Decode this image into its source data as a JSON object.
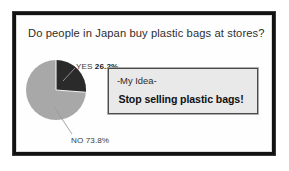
{
  "slide": {
    "title": "Do people in Japan buy plastic bags at stores?"
  },
  "idea_box": {
    "heading": "-My Idea-",
    "statement": "Stop selling plastic bags!"
  },
  "labels": {
    "yes_prefix": "YES ",
    "yes_value": "26.2%",
    "no_prefix": "NO ",
    "no_value": "73.8%"
  },
  "colors": {
    "yes_slice": "#2a2a2a",
    "no_slice": "#a8a8a8",
    "frame": "#121212",
    "idea_box_fill": "#e9e9e9",
    "idea_box_border": "#4a4a4a",
    "text": "#2e2e2e",
    "leader_line": "#9b9b9b"
  },
  "chart_data": {
    "type": "pie",
    "title": "Do people in Japan buy plastic bags at stores?",
    "categories": [
      "YES",
      "NO"
    ],
    "values": [
      26.2,
      73.8
    ],
    "unit": "%",
    "labels": [
      "YES 26.2%",
      "NO 73.8%"
    ],
    "colors": [
      "#2a2a2a",
      "#a8a8a8"
    ],
    "start_angle_deg": 0,
    "direction": "clockwise",
    "legend": "none",
    "data_labels": true,
    "grid": false
  }
}
